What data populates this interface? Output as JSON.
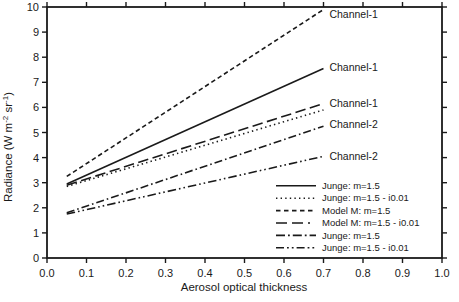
{
  "figure": {
    "background": "#ffffff",
    "ink": "#1a1a1a"
  },
  "chart_data": {
    "type": "line",
    "title": "",
    "xlabel": "Aerosol optical thickness",
    "ylabel": "Radiance (W m-2 sr-1)",
    "ylabel_parts": [
      {
        "t": "Radiance (W m"
      },
      {
        "t": "-2",
        "sup": true
      },
      {
        "t": " sr"
      },
      {
        "t": "-1",
        "sup": true
      },
      {
        "t": ")"
      }
    ],
    "xlim": [
      0.0,
      1.0
    ],
    "ylim": [
      0,
      10
    ],
    "xticks": {
      "values": [
        0.0,
        0.1,
        0.2,
        0.3,
        0.4,
        0.5,
        0.6,
        0.7,
        0.8,
        0.9,
        1.0
      ],
      "labels": [
        "0.0",
        "0.1",
        "0.2",
        "0.3",
        "0.4",
        "0.5",
        "0.6",
        "0.7",
        "0.8",
        "0.9",
        "1.0"
      ]
    },
    "yticks": {
      "values": [
        0,
        1,
        2,
        3,
        4,
        5,
        6,
        7,
        8,
        9,
        10
      ],
      "labels": [
        "0",
        "1",
        "2",
        "3",
        "4",
        "5",
        "6",
        "7",
        "8",
        "9",
        "10"
      ]
    },
    "grid": false,
    "frame_ticks": "all-four-sides-outward",
    "series": [
      {
        "name": "Junge: m=1.5",
        "channel": "Channel-1",
        "linestyle": "solid",
        "x": [
          0.05,
          0.7
        ],
        "y": [
          2.95,
          7.55
        ]
      },
      {
        "name": "Junge: m=1.5 - i0.01",
        "channel": "Channel-1",
        "linestyle": "dotted",
        "x": [
          0.05,
          0.7
        ],
        "y": [
          2.85,
          5.9
        ]
      },
      {
        "name": "Model M: m=1.5",
        "channel": "Channel-1",
        "linestyle": "dash",
        "x": [
          0.05,
          0.7
        ],
        "y": [
          3.25,
          9.9
        ]
      },
      {
        "name": "Model M: m=1.5 - i0.01",
        "channel": "Channel-1",
        "linestyle": "longdash",
        "x": [
          0.05,
          0.7
        ],
        "y": [
          2.9,
          6.15
        ]
      },
      {
        "name": "Junge: m=1.5",
        "channel": "Channel-2",
        "linestyle": "dashdot",
        "x": [
          0.05,
          0.7
        ],
        "y": [
          1.8,
          5.25
        ]
      },
      {
        "name": "Junge: m=1.5 - i0.01",
        "channel": "Channel-2",
        "linestyle": "dashdotdot",
        "x": [
          0.05,
          0.7
        ],
        "y": [
          1.75,
          4.05
        ]
      }
    ],
    "annotations": [
      {
        "text": "Channel-1",
        "x": 0.715,
        "y": 9.7
      },
      {
        "text": "Channel-1",
        "x": 0.715,
        "y": 7.6
      },
      {
        "text": "Channel-1",
        "x": 0.715,
        "y": 6.15
      },
      {
        "text": "Channel-2",
        "x": 0.715,
        "y": 5.3
      },
      {
        "text": "Channel-2",
        "x": 0.715,
        "y": 4.05
      }
    ],
    "legend": {
      "position": "lower right",
      "border": false,
      "entries": [
        {
          "label": "Junge: m=1.5",
          "linestyle": "solid"
        },
        {
          "label": "Junge: m=1.5 - i0.01",
          "linestyle": "dotted"
        },
        {
          "label": "Model M: m=1.5",
          "linestyle": "dash"
        },
        {
          "label": "Model M: m=1.5 - i0.01",
          "linestyle": "longdash"
        },
        {
          "label": "Junge: m=1.5",
          "linestyle": "dashdot"
        },
        {
          "label": "Junge: m=1.5 - i0.01",
          "linestyle": "dashdotdot"
        }
      ]
    }
  }
}
